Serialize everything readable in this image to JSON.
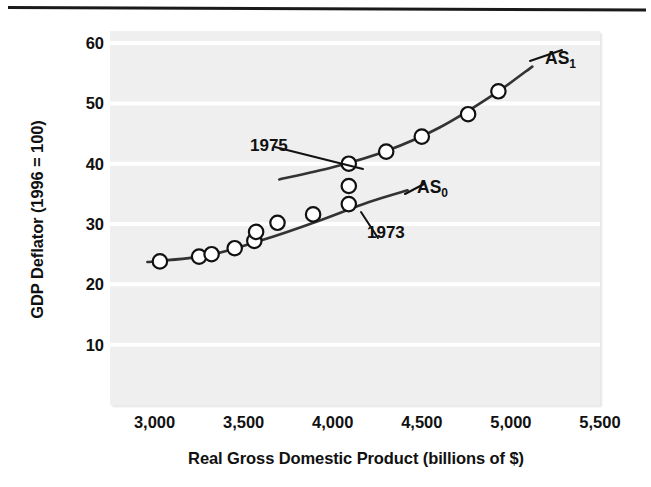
{
  "figure": {
    "background_color": "#ffffff",
    "plot_background_color": "#efefef",
    "gridline_color": "#ffffff",
    "ink_color": "#333333"
  },
  "axes": {
    "y_title": "GDP Deflator (1996 = 100)",
    "x_title": "Real Gross Domestic Product (billions of $)",
    "y_ticks": [
      "10",
      "20",
      "30",
      "40",
      "50",
      "60"
    ],
    "x_ticks": [
      "3,000",
      "3,500",
      "4,000",
      "4,500",
      "5,000",
      "5,500"
    ]
  },
  "annotations": {
    "year_1975": "1975",
    "year_1973": "1973",
    "curve_as1_base": "AS",
    "curve_as1_sub": "1",
    "curve_as0_base": "AS",
    "curve_as0_sub": "0"
  },
  "chart_data": {
    "type": "scatter",
    "title": "",
    "xlabel": "Real Gross Domestic Product (billions of $)",
    "ylabel": "GDP Deflator (1996 = 100)",
    "xlim": [
      2750,
      5500
    ],
    "ylim": [
      0,
      62
    ],
    "x_ticks": [
      3000,
      3500,
      4000,
      4500,
      5000,
      5500
    ],
    "y_ticks": [
      10,
      20,
      30,
      40,
      50,
      60
    ],
    "grid": "horizontal-white-lines",
    "legend": "inline-curve-labels",
    "series": [
      {
        "name": "AS0",
        "label": "AS₀",
        "kind": "curve-with-points",
        "points": [
          {
            "x": 3030,
            "y": 23.8
          },
          {
            "x": 3250,
            "y": 24.6
          },
          {
            "x": 3320,
            "y": 25.0
          },
          {
            "x": 3450,
            "y": 26.0
          },
          {
            "x": 3560,
            "y": 27.2
          },
          {
            "x": 3570,
            "y": 28.7
          },
          {
            "x": 3690,
            "y": 30.2
          },
          {
            "x": 3890,
            "y": 31.6
          },
          {
            "x": 4090,
            "y": 33.3,
            "annotation": "1973"
          },
          {
            "x": 4090,
            "y": 36.3
          }
        ],
        "curve": [
          {
            "x": 2960,
            "y": 23.7
          },
          {
            "x": 3300,
            "y": 24.8
          },
          {
            "x": 3600,
            "y": 27.3
          },
          {
            "x": 3900,
            "y": 30.3
          },
          {
            "x": 4200,
            "y": 33.6
          },
          {
            "x": 4420,
            "y": 35.6
          }
        ]
      },
      {
        "name": "AS1",
        "label": "AS₁",
        "kind": "curve-with-points",
        "points": [
          {
            "x": 4090,
            "y": 40.0,
            "annotation": "1975"
          },
          {
            "x": 4300,
            "y": 42.0
          },
          {
            "x": 4500,
            "y": 44.5
          },
          {
            "x": 4760,
            "y": 48.2
          },
          {
            "x": 4930,
            "y": 52.0
          }
        ],
        "curve": [
          {
            "x": 3700,
            "y": 37.4
          },
          {
            "x": 4000,
            "y": 39.4
          },
          {
            "x": 4300,
            "y": 42.1
          },
          {
            "x": 4600,
            "y": 46.0
          },
          {
            "x": 4900,
            "y": 51.4
          },
          {
            "x": 5120,
            "y": 56.1
          }
        ]
      }
    ]
  }
}
